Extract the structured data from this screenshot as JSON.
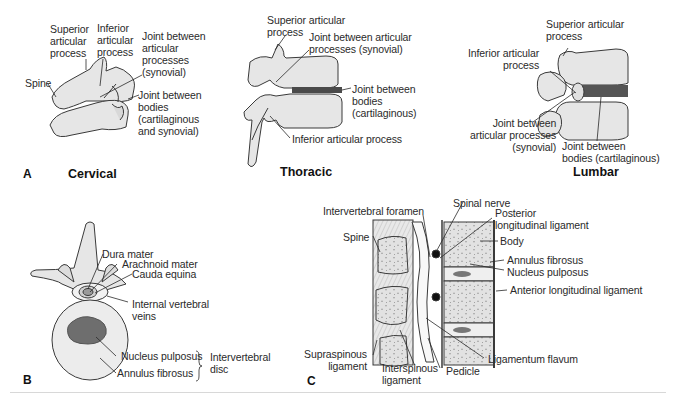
{
  "panels": {
    "A": {
      "letter": "A",
      "cervical": {
        "title": "Cervical",
        "labels": {
          "superior": "Superior\narticular\nprocess",
          "inferior": "Inferior\narticular\nprocess",
          "joint_articular": "Joint between\narticular\nprocesses\n(synovial)",
          "spine": "Spine",
          "joint_bodies": "Joint between\nbodies\n(cartilaginous\nand synovial)"
        }
      },
      "thoracic": {
        "title": "Thoracic",
        "labels": {
          "superior": "Superior articular\nprocess",
          "joint_articular": "Joint between articular\nprocesses (synovial)",
          "joint_bodies": "Joint between\nbodies\n(cartilaginous)",
          "inferior": "Inferior articular process"
        }
      },
      "lumbar": {
        "title": "Lumbar",
        "labels": {
          "superior": "Superior articular\nprocess",
          "inferior": "Inferior articular\nprocess",
          "joint_articular": "Joint between\narticular processes\n(synovial)",
          "joint_bodies": "Joint between\nbodies (cartilaginous)"
        }
      }
    },
    "B": {
      "letter": "B",
      "labels": {
        "dura": "Dura mater",
        "arachnoid": "Arachnoid mater",
        "cauda": "Cauda equina",
        "veins": "Internal vertebral\nveins",
        "nucleus": "Nucleus pulposus",
        "annulus": "Annulus fibrosus",
        "disc": "Intervertebral\ndisc"
      }
    },
    "C": {
      "letter": "C",
      "labels": {
        "foramen": "Intervertebral foramen",
        "spinal_nerve": "Spinal nerve",
        "posterior_lig": "Posterior\nlongitudinal ligament",
        "spine": "Spine",
        "body": "Body",
        "annulus": "Annulus fibrosus",
        "nucleus": "Nucleus pulposus",
        "anterior_lig": "Anterior longitudinal ligament",
        "supraspinous": "Supraspinous\nligament",
        "interspinous": "Interspinous\nligament",
        "pedicle": "Pedicle",
        "flavum": "Ligamentum flavum"
      }
    }
  },
  "colors": {
    "bone": "#e4e4e4",
    "bone_stroke": "#3a3a3a",
    "nucleus": "#6e6e6e",
    "disc_dark": "#555555",
    "divider": "#d8d8d8"
  }
}
